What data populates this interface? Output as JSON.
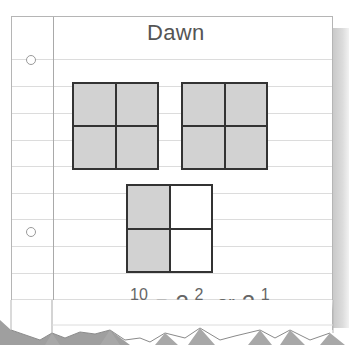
{
  "title": "Dawn",
  "models": [
    {
      "cells": [
        true,
        true,
        true,
        true
      ],
      "label": "whole-1"
    },
    {
      "cells": [
        true,
        true,
        true,
        true
      ],
      "label": "whole-2"
    },
    {
      "cells": [
        true,
        false,
        true,
        false
      ],
      "label": "partial"
    }
  ],
  "equation": {
    "lhs_numerator": "10",
    "lhs_denominator": "4",
    "equals": "=",
    "mixed1_whole": "2",
    "mixed1_numerator": "2",
    "mixed1_denominator": "4",
    "connector": ", or",
    "mixed2_whole": "2",
    "mixed2_numerator": "1",
    "mixed2_denominator": "2"
  },
  "colors": {
    "shaded": "#d2d2d2",
    "grid_line": "#333333",
    "text": "#666666"
  }
}
